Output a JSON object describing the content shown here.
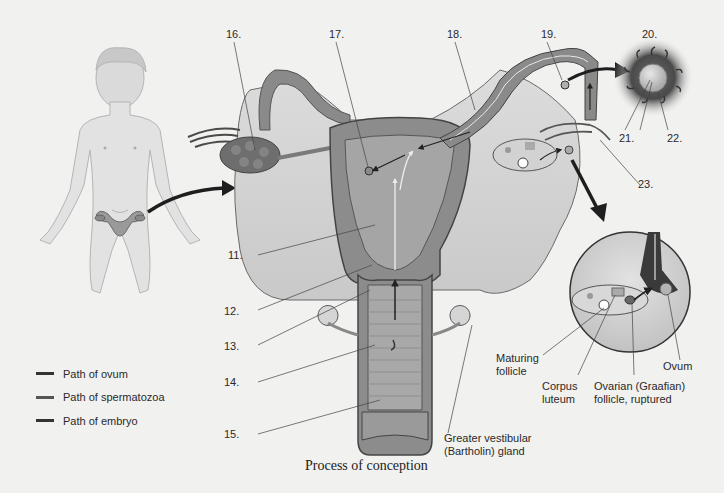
{
  "figure": {
    "caption": "Process of conception",
    "number_labels": [
      {
        "id": "11",
        "text": "11."
      },
      {
        "id": "12",
        "text": "12."
      },
      {
        "id": "13",
        "text": "13."
      },
      {
        "id": "14",
        "text": "14."
      },
      {
        "id": "15",
        "text": "15."
      },
      {
        "id": "16",
        "text": "16."
      },
      {
        "id": "17",
        "text": "17."
      },
      {
        "id": "18",
        "text": "18."
      },
      {
        "id": "19",
        "text": "19."
      },
      {
        "id": "20",
        "text": "20."
      },
      {
        "id": "21",
        "text": "21."
      },
      {
        "id": "22",
        "text": "22."
      },
      {
        "id": "23",
        "text": "23."
      }
    ],
    "named_labels": {
      "maturing_follicle": [
        "Maturing",
        "follicle"
      ],
      "corpus_luteum": [
        "Corpus",
        "luteum"
      ],
      "ovarian_follicle": [
        "Ovarian (Graafian)",
        "follicle, ruptured"
      ],
      "ovum": "Ovum",
      "bartholin_gland": [
        "Greater vestibular",
        "(Bartholin) gland"
      ]
    },
    "legend": [
      {
        "label": "Path of ovum",
        "color": "#2b2b2b"
      },
      {
        "label": "Path of spermatozoa",
        "color": "#4a4a4a"
      },
      {
        "label": "Path of embryo",
        "color": "#333333"
      }
    ]
  }
}
